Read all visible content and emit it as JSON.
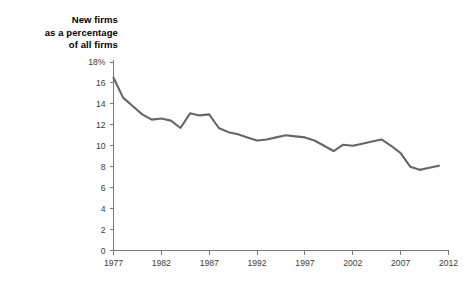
{
  "chart_data": {
    "type": "line",
    "title": "New firms\nas a percentage\nof all firms",
    "xlabel": "",
    "ylabel": "",
    "xlim": [
      1977,
      2012
    ],
    "ylim": [
      0,
      18
    ],
    "grid": false,
    "legend": null,
    "y_tick_labels": [
      "18%",
      "16",
      "14",
      "12",
      "10",
      "8",
      "6",
      "4",
      "2",
      "0"
    ],
    "y_ticks": [
      18,
      16,
      14,
      12,
      10,
      8,
      6,
      4,
      2,
      0
    ],
    "x_tick_labels": [
      "1977",
      "1982",
      "1987",
      "1992",
      "1997",
      "2002",
      "2007",
      "2012"
    ],
    "x_ticks": [
      1977,
      1982,
      1987,
      1992,
      1997,
      2002,
      2007,
      2012
    ],
    "line_color": "#666666",
    "x": [
      1977,
      1978,
      1979,
      1980,
      1981,
      1982,
      1983,
      1984,
      1985,
      1986,
      1987,
      1988,
      1989,
      1990,
      1991,
      1992,
      1993,
      1994,
      1995,
      1996,
      1997,
      1998,
      1999,
      2000,
      2001,
      2002,
      2003,
      2004,
      2005,
      2006,
      2007,
      2008,
      2009,
      2010,
      2011
    ],
    "values": [
      16.5,
      14.6,
      13.8,
      13.0,
      12.5,
      12.6,
      12.4,
      11.7,
      13.1,
      12.9,
      13.0,
      11.7,
      11.3,
      11.1,
      10.8,
      10.5,
      10.6,
      10.8,
      11.0,
      10.9,
      10.8,
      10.5,
      10.0,
      9.5,
      10.1,
      10.0,
      10.2,
      10.4,
      10.6,
      10.0,
      9.3,
      8.0,
      7.7,
      7.9,
      8.1
    ],
    "series": [
      {
        "name": "New firms as a percentage of all firms",
        "values": [
          16.5,
          14.6,
          13.8,
          13.0,
          12.5,
          12.6,
          12.4,
          11.7,
          13.1,
          12.9,
          13.0,
          11.7,
          11.3,
          11.1,
          10.8,
          10.5,
          10.6,
          10.8,
          11.0,
          10.9,
          10.8,
          10.5,
          10.0,
          9.5,
          10.1,
          10.0,
          10.2,
          10.4,
          10.6,
          10.0,
          9.3,
          8.0,
          7.7,
          7.9,
          8.1
        ]
      }
    ]
  }
}
